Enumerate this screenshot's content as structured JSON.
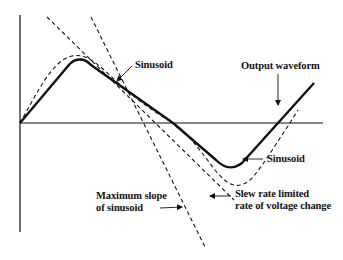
{
  "diagram": {
    "colors": {
      "ink": "#111111",
      "background": "#ffffff"
    },
    "axes": {
      "y_axis": {
        "x": 20,
        "y_top": 15,
        "y_bottom": 232
      },
      "x_axis": {
        "y": 123,
        "x_left": 20,
        "x_right": 323
      }
    },
    "labels": {
      "sinusoid_top": "Sinusoid",
      "output_waveform": "Output waveform",
      "sinusoid_right": "Sinusoid",
      "max_slope_line1": "Maximum slope",
      "max_slope_line2": "of sinusoid",
      "slew_line1": "Slew rate limited",
      "slew_line2": "rate of voltage change"
    },
    "curves": [
      {
        "name": "Output waveform",
        "style": "solid-thick"
      },
      {
        "name": "Sinusoid",
        "style": "dashed"
      },
      {
        "name": "Maximum slope of sinusoid",
        "style": "dashed-tangent"
      },
      {
        "name": "Slew rate limited rate of voltage change",
        "style": "dashed-tangent"
      }
    ]
  }
}
